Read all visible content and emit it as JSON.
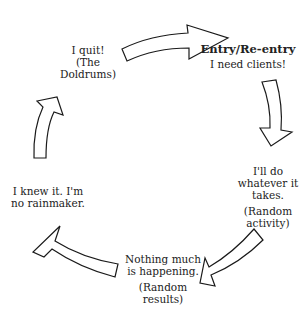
{
  "diagram": {
    "type": "cycle",
    "nodes": [
      {
        "id": "entry",
        "title": "Entry/Re-entry",
        "lines": [
          "I need clients!"
        ]
      },
      {
        "id": "whatever",
        "lines": [
          "I'll do",
          "whatever it",
          "takes."
        ],
        "sub": [
          "(Random",
          "activity)"
        ]
      },
      {
        "id": "nothing",
        "lines": [
          "Nothing much",
          "is happening."
        ],
        "sub": [
          "(Random",
          "results)"
        ]
      },
      {
        "id": "knew",
        "lines": [
          "I knew it.  I'm",
          "no rainmaker."
        ]
      },
      {
        "id": "quit",
        "lines": [
          "I quit!",
          "(The",
          "Doldrums)"
        ]
      }
    ],
    "arrows": [
      {
        "from": "quit",
        "to": "entry",
        "direction": "right"
      },
      {
        "from": "entry",
        "to": "whatever",
        "direction": "down"
      },
      {
        "from": "whatever",
        "to": "nothing",
        "direction": "down-left"
      },
      {
        "from": "nothing",
        "to": "knew",
        "direction": "up-left"
      },
      {
        "from": "knew",
        "to": "quit",
        "direction": "up"
      }
    ]
  }
}
